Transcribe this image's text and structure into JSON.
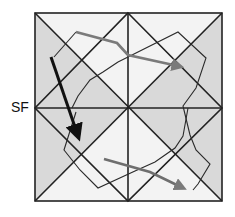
{
  "label": "SF",
  "colors": {
    "shade": "#d9d9d9",
    "light": "#f3f3f3",
    "grid_line": "#222222",
    "black_arrow": "#111111",
    "gray_arrow": "#7a7a7a",
    "path_line": "#2a2a2a"
  },
  "arrows": [
    {
      "name": "black-arrow",
      "color": "black"
    },
    {
      "name": "gray-arrow-top",
      "color": "gray"
    },
    {
      "name": "gray-arrow-bottom",
      "color": "gray"
    }
  ]
}
